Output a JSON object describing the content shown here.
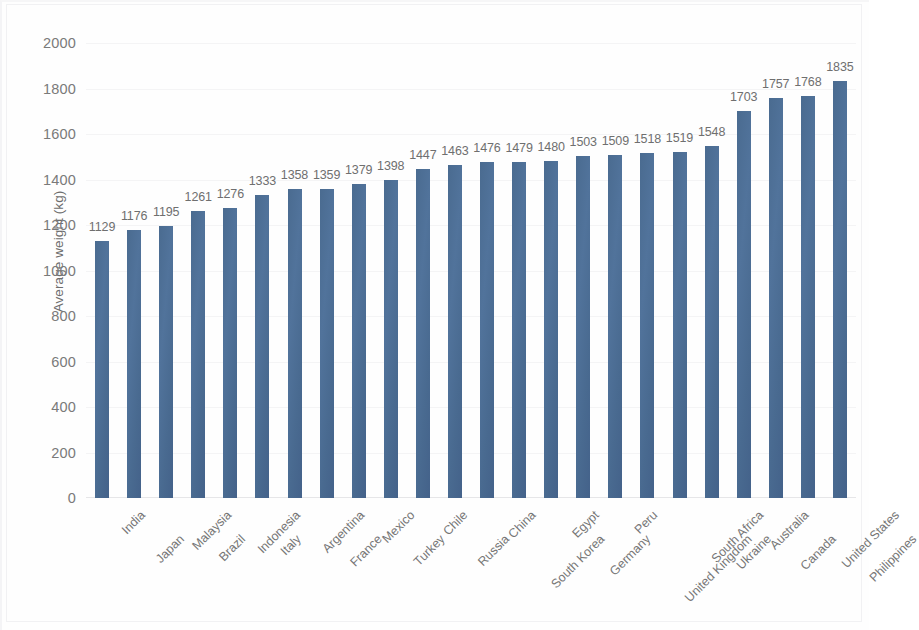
{
  "chart_data": {
    "type": "bar",
    "title": "",
    "subtitle": "",
    "xlabel": "",
    "ylabel": "Average weight (kg)",
    "ylim": [
      0,
      2000
    ],
    "ytick_step": 200,
    "yticks": [
      2000,
      1800,
      1600,
      1400,
      1200,
      1000,
      800,
      600,
      400,
      200,
      0
    ],
    "grid": true,
    "legend": "none",
    "bar_color": "#4a6b90",
    "data_labels": true,
    "categories": [
      "India",
      "Japan",
      "Malaysia",
      "Brazil",
      "Indonesia",
      "Italy",
      "Argentina",
      "France",
      "Mexico",
      "Turkey",
      "Chile",
      "Russia",
      "China",
      "South Korea",
      "Egypt",
      "Germany",
      "Peru",
      "United Kingdom",
      "South Africa",
      "Ukraine",
      "Australia",
      "Canada",
      "United States",
      "Philippines"
    ],
    "values": [
      1129,
      1176,
      1195,
      1261,
      1276,
      1333,
      1358,
      1359,
      1379,
      1398,
      1447,
      1463,
      1476,
      1479,
      1480,
      1503,
      1509,
      1518,
      1519,
      1548,
      1703,
      1757,
      1768,
      1835
    ]
  }
}
